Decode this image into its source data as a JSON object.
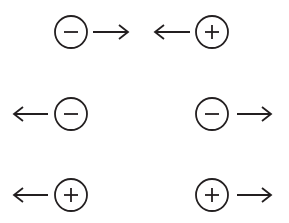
{
  "diagram": {
    "stroke_color": "#231f20",
    "background_color": "#ffffff",
    "rows": [
      {
        "id": "row-1",
        "description": "Negative charge moving right, positive charge moving left (toward each other)",
        "items": [
          {
            "type": "charge",
            "sign": "negative",
            "symbol": "−",
            "cx": 71,
            "cy": 32
          },
          {
            "type": "arrow",
            "direction": "right",
            "x1": 93,
            "x2": 128,
            "y": 32
          },
          {
            "type": "arrow",
            "direction": "left",
            "x1": 190,
            "x2": 155,
            "y": 32
          },
          {
            "type": "charge",
            "sign": "positive",
            "symbol": "+",
            "cx": 212,
            "cy": 32
          }
        ]
      },
      {
        "id": "row-2",
        "description": "Two negative charges moving apart",
        "items": [
          {
            "type": "arrow",
            "direction": "left",
            "x1": 48,
            "x2": 14,
            "y": 114
          },
          {
            "type": "charge",
            "sign": "negative",
            "symbol": "−",
            "cx": 71,
            "cy": 114
          },
          {
            "type": "charge",
            "sign": "negative",
            "symbol": "−",
            "cx": 212,
            "cy": 114
          },
          {
            "type": "arrow",
            "direction": "right",
            "x1": 237,
            "x2": 271,
            "y": 114
          }
        ]
      },
      {
        "id": "row-3",
        "description": "Two positive charges moving apart",
        "items": [
          {
            "type": "arrow",
            "direction": "left",
            "x1": 48,
            "x2": 14,
            "y": 195
          },
          {
            "type": "charge",
            "sign": "positive",
            "symbol": "+",
            "cx": 71,
            "cy": 195
          },
          {
            "type": "charge",
            "sign": "positive",
            "symbol": "+",
            "cx": 212,
            "cy": 195
          },
          {
            "type": "arrow",
            "direction": "right",
            "x1": 237,
            "x2": 271,
            "y": 195
          }
        ]
      }
    ],
    "charge_radius": 16,
    "sign_half_length": 7,
    "arrowhead_length": 9,
    "arrowhead_half_width": 7
  }
}
